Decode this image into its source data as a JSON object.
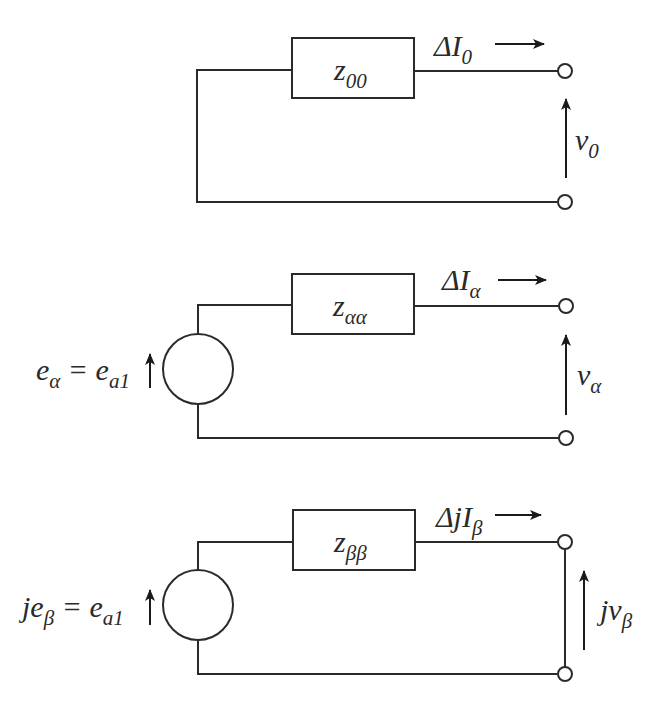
{
  "diagram": {
    "circuits": [
      {
        "id": "zero",
        "impedance": {
          "main": "z",
          "sub": "00"
        },
        "current": {
          "prefix": "ΔI",
          "sub": "0"
        },
        "voltage": {
          "main": "v",
          "sub": "0"
        },
        "source": null,
        "terminals_shorted": false
      },
      {
        "id": "alpha",
        "impedance": {
          "main": "z",
          "sub": "αα"
        },
        "current": {
          "prefix": "ΔI",
          "sub": "α"
        },
        "voltage": {
          "main": "v",
          "sub": "α"
        },
        "source": {
          "lhs_main": "e",
          "lhs_sub": "α",
          "eq": " = ",
          "rhs_main": "e",
          "rhs_sub": "a1"
        },
        "terminals_shorted": false
      },
      {
        "id": "beta",
        "impedance": {
          "main": "z",
          "sub": "ββ"
        },
        "current": {
          "prefix": "ΔjI",
          "sub": "β"
        },
        "voltage": {
          "main": "jv",
          "sub": "β"
        },
        "source": {
          "lhs_main": "je",
          "lhs_sub": "β",
          "eq": " = ",
          "rhs_main": "e",
          "rhs_sub": "a1"
        },
        "terminals_shorted": true
      }
    ]
  }
}
